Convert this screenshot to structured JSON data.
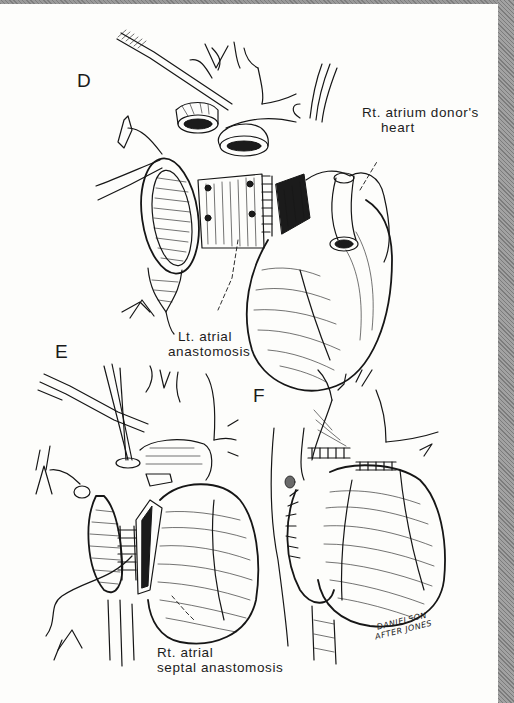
{
  "figure": {
    "colors": {
      "paper": "#fdfdfb",
      "ink": "#161616",
      "scan_border": "#8c8c8c"
    },
    "panels": [
      {
        "letter": "D",
        "labels": [
          {
            "lines": [
              "Rt. atrium donor's",
              "heart"
            ]
          },
          {
            "lines": [
              "Lt. atrial",
              "anastomosis"
            ]
          }
        ]
      },
      {
        "letter": "E",
        "labels": [
          {
            "lines": [
              "Rt. atrial",
              "septal anastomosis"
            ]
          }
        ]
      },
      {
        "letter": "F",
        "labels": []
      }
    ],
    "signature": {
      "line1": "DANIELSON",
      "line2": "AFTER JONES"
    }
  }
}
